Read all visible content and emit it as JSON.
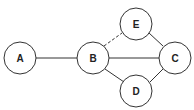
{
  "diagram": {
    "type": "graph",
    "nodes": [
      {
        "id": "A",
        "label": "A",
        "cx": 20,
        "cy": 58
      },
      {
        "id": "B",
        "label": "B",
        "cx": 93,
        "cy": 58
      },
      {
        "id": "C",
        "label": "C",
        "cx": 175,
        "cy": 58
      },
      {
        "id": "D",
        "label": "D",
        "cx": 136,
        "cy": 91
      },
      {
        "id": "E",
        "label": "E",
        "cx": 136,
        "cy": 24
      }
    ],
    "edges": [
      {
        "from": "A",
        "to": "B",
        "style": "solid"
      },
      {
        "from": "B",
        "to": "C",
        "style": "solid"
      },
      {
        "from": "B",
        "to": "D",
        "style": "solid"
      },
      {
        "from": "D",
        "to": "C",
        "style": "solid"
      },
      {
        "from": "E",
        "to": "C",
        "style": "solid"
      },
      {
        "from": "B",
        "to": "E",
        "style": "dashed"
      }
    ],
    "node_radius": 16,
    "stroke_color": "#333333"
  }
}
